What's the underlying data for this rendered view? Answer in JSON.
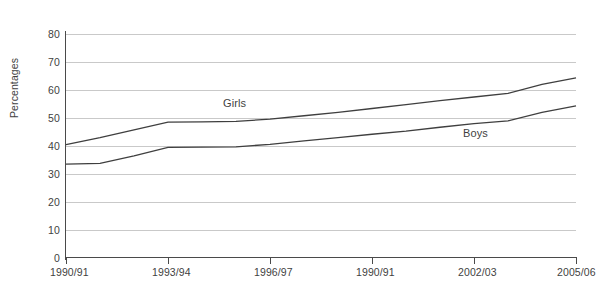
{
  "chart_data": {
    "type": "line",
    "title": "",
    "subtitle": "",
    "xlabel": "",
    "ylabel": "Percentages",
    "ylim": [
      0,
      80
    ],
    "yticks": [
      0,
      10,
      20,
      30,
      40,
      50,
      60,
      70,
      80
    ],
    "ytick_labels": [
      "0",
      "10",
      "20",
      "30",
      "40",
      "50",
      "60",
      "70",
      "80"
    ],
    "grid": true,
    "legend_position": "inline-annotations",
    "x": [
      "1990/91",
      "1991/92",
      "1992/93",
      "1993/94",
      "1994/95",
      "1995/96",
      "1996/97",
      "1997/98",
      "1998/99",
      "1999/00",
      "2000/01",
      "2001/02",
      "2002/03",
      "2003/04",
      "2004/05",
      "2005/06"
    ],
    "xticks": [
      "1990/91",
      "1993/94",
      "1996/97",
      "1990/91",
      "2002/03",
      "2005/06"
    ],
    "xtick_positions": [
      0,
      3,
      6,
      9,
      12,
      15
    ],
    "series": [
      {
        "name": "Girls",
        "color": "#3f3f3f",
        "values": [
          40.5,
          43.0,
          45.8,
          48.5,
          48.6,
          48.8,
          49.6,
          50.8,
          52.0,
          53.4,
          54.8,
          56.2,
          57.5,
          58.8,
          62.0,
          64.3
        ]
      },
      {
        "name": "Boys",
        "color": "#3f3f3f",
        "values": [
          33.5,
          33.8,
          36.5,
          39.5,
          39.6,
          39.7,
          40.6,
          41.8,
          43.0,
          44.2,
          45.3,
          46.7,
          48.0,
          49.0,
          52.0,
          54.3
        ]
      }
    ],
    "annotations": [
      {
        "text": "Girls",
        "x_px": 223,
        "y_px": 97
      },
      {
        "text": "Boys",
        "x_px": 463,
        "y_px": 127
      }
    ]
  }
}
